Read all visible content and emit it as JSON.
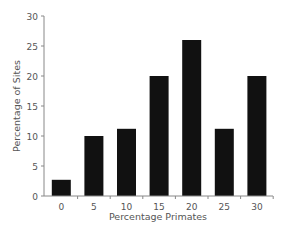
{
  "chart_data": {
    "type": "bar",
    "title": "",
    "xlabel": "Percentage Primates",
    "ylabel": "Percentage of Sites",
    "categories": [
      "0",
      "5",
      "10",
      "15",
      "20",
      "25",
      "30"
    ],
    "values": [
      2.7,
      10,
      11.2,
      20,
      26,
      11.2,
      20
    ],
    "ylim": [
      0,
      30
    ],
    "yticks": [
      "0",
      "5",
      "10",
      "15",
      "20",
      "25",
      "30"
    ],
    "grid": false,
    "legend": null,
    "colors": {
      "bar": "#111111",
      "axis": "#888888",
      "text": "#555555"
    }
  }
}
